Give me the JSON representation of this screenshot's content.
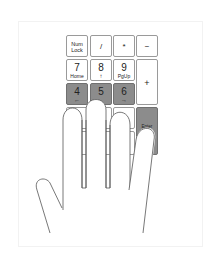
{
  "figure": {
    "highlight_color": "#8c8c8c",
    "keys": [
      {
        "id": "numlock",
        "main": "Num",
        "sub": "Lock",
        "highlighted": false
      },
      {
        "id": "divide",
        "main": "/",
        "sub": "",
        "highlighted": false
      },
      {
        "id": "multiply",
        "main": "*",
        "sub": "",
        "highlighted": false
      },
      {
        "id": "minus",
        "main": "−",
        "sub": "",
        "highlighted": false
      },
      {
        "id": "seven",
        "main": "7",
        "sub": "Home",
        "highlighted": false
      },
      {
        "id": "eight",
        "main": "8",
        "sub": "↑",
        "highlighted": false
      },
      {
        "id": "nine",
        "main": "9",
        "sub": "PgUp",
        "highlighted": false
      },
      {
        "id": "plus",
        "main": "+",
        "sub": "",
        "highlighted": false
      },
      {
        "id": "four",
        "main": "4",
        "sub": "←",
        "highlighted": true
      },
      {
        "id": "five",
        "main": "5",
        "sub": "",
        "highlighted": true
      },
      {
        "id": "six",
        "main": "6",
        "sub": "→",
        "highlighted": true
      },
      {
        "id": "enter",
        "main": "Enter",
        "sub": "",
        "highlighted": true
      }
    ]
  }
}
